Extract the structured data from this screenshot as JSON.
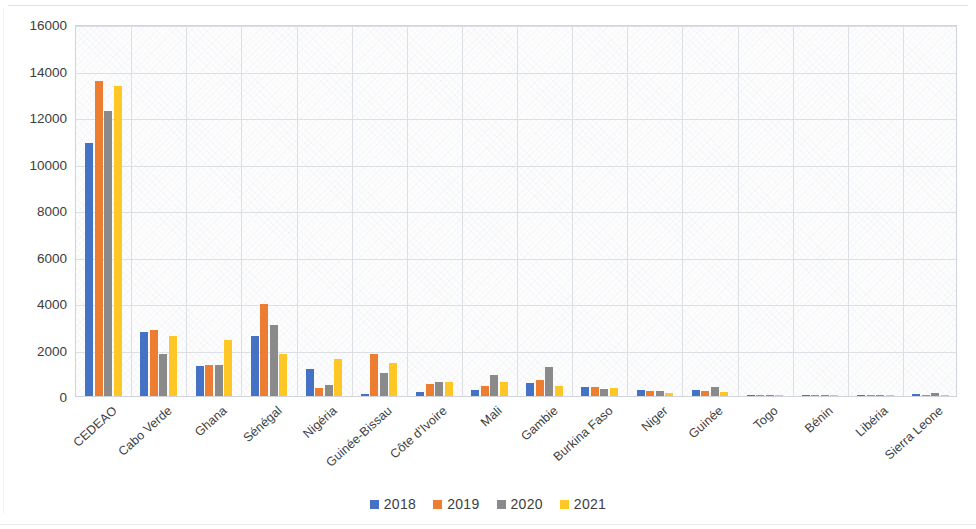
{
  "chart_data": {
    "type": "bar",
    "title": "",
    "subtitle": "",
    "xlabel": "",
    "ylabel": "",
    "ylim": [
      0,
      16000
    ],
    "ytick_values": [
      0,
      2000,
      4000,
      6000,
      8000,
      10000,
      12000,
      14000,
      16000
    ],
    "ytick_labels": [
      "0",
      "2000",
      "4000",
      "6000",
      "8000",
      "10000",
      "12000",
      "14000",
      "16000"
    ],
    "grid": "horizontal-and-vertical",
    "legend_position": "bottom",
    "categories": [
      "CEDEAO",
      "Cabo Verde",
      "Ghana",
      "Sénégal",
      "Nigéria",
      "Guinée-Bissau",
      "Côte d'Ivoire",
      "Mali",
      "Gambie",
      "Burkina Faso",
      "Niger",
      "Guinée",
      "Togo",
      "Bénin",
      "Libéria",
      "Sierra Leone"
    ],
    "series": [
      {
        "name": "2018",
        "color": "#4472c4",
        "values": [
          10900,
          2750,
          1300,
          2600,
          1150,
          80,
          180,
          280,
          550,
          380,
          270,
          270,
          60,
          20,
          15,
          80
        ]
      },
      {
        "name": "2019",
        "color": "#ed7d31",
        "values": [
          13550,
          2850,
          1350,
          3950,
          350,
          1820,
          520,
          420,
          700,
          400,
          200,
          200,
          40,
          15,
          10,
          25
        ]
      },
      {
        "name": "2020",
        "color": "#8a8a8a",
        "values": [
          12250,
          1800,
          1350,
          3050,
          480,
          1000,
          600,
          900,
          1230,
          300,
          200,
          400,
          30,
          20,
          10,
          130
        ]
      },
      {
        "name": "2021",
        "color": "#ffc726",
        "values": [
          13350,
          2600,
          2400,
          1800,
          1580,
          1400,
          620,
          600,
          450,
          330,
          150,
          180,
          35,
          15,
          10,
          20
        ]
      }
    ]
  },
  "legend": {
    "items": [
      {
        "label": "2018",
        "color": "#4472c4"
      },
      {
        "label": "2019",
        "color": "#ed7d31"
      },
      {
        "label": "2020",
        "color": "#8a8a8a"
      },
      {
        "label": "2021",
        "color": "#ffc726"
      }
    ]
  }
}
